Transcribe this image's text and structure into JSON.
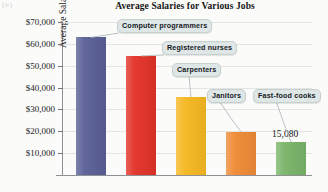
{
  "figure": {
    "corner_mark": "(b)",
    "background_color": "#fbfbfa"
  },
  "chart_data": {
    "type": "bar",
    "title": "Average Salaries for Various Jobs",
    "xlabel": "",
    "ylabel": "Average Salary",
    "ylim": [
      0,
      70000
    ],
    "grid": true,
    "legend_position": "none",
    "categories": [
      "Computer programmers",
      "Registered nurses",
      "Carpenters",
      "Janitors",
      "Fast-food cooks"
    ],
    "values": [
      63000,
      54500,
      35500,
      19800,
      15080
    ],
    "bar_colors": [
      "#5a5f96",
      "#e23228",
      "#f5b821",
      "#ef8b36",
      "#7ab469"
    ],
    "ytick_labels": [
      "$10,000",
      "$20,000",
      "$30,000",
      "$40,000",
      "$50,000",
      "$60,000",
      "$70,000"
    ],
    "ytick_values": [
      10000,
      20000,
      30000,
      40000,
      50000,
      60000,
      70000
    ],
    "annotations": [
      {
        "text": "15,080",
        "series_index": 4
      }
    ],
    "callouts": [
      {
        "label": "Computer programmers",
        "target_bar": 0
      },
      {
        "label": "Registered nurses",
        "target_bar": 1
      },
      {
        "label": "Carpenters",
        "target_bar": 2
      },
      {
        "label": "Janitors",
        "target_bar": 3
      },
      {
        "label": "Fast-food cooks",
        "target_bar": 4
      }
    ]
  }
}
